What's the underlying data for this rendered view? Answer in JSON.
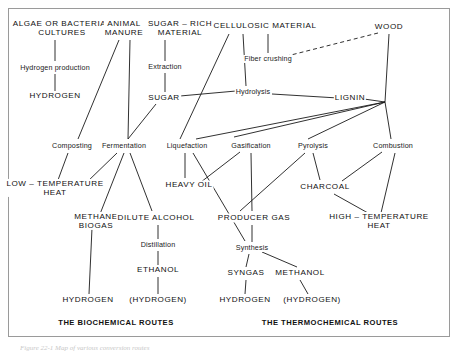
{
  "figure": {
    "caption": "Figure 22-1  Map of various conversion routes",
    "frame_color": "#9a9a9a"
  },
  "section_titles": {
    "biochemical": "THE BIOCHEMICAL ROUTES",
    "thermochemical": "THE THERMOCHEMICAL ROUTES"
  },
  "nodes": [
    {
      "id": "algae",
      "label": "ALGAE OR BACTERIAL\nCULTURES",
      "x": 62,
      "y": 28,
      "style": "cap"
    },
    {
      "id": "animal",
      "label": "ANIMAL\nMANURE",
      "x": 124,
      "y": 28,
      "style": "cap"
    },
    {
      "id": "sugarrich",
      "label": "SUGAR – RICH\nMATERIAL",
      "x": 180,
      "y": 28,
      "style": "cap"
    },
    {
      "id": "cellulosic",
      "label": "CELLULOSIC MATERIAL",
      "x": 265,
      "y": 26,
      "style": "cap"
    },
    {
      "id": "wood",
      "label": "WOOD",
      "x": 389,
      "y": 27,
      "style": "cap"
    },
    {
      "id": "hydprod",
      "label": "Hydrogen production",
      "x": 55,
      "y": 68,
      "style": "proc"
    },
    {
      "id": "extraction",
      "label": "Extraction",
      "x": 165,
      "y": 67,
      "style": "proc"
    },
    {
      "id": "fiber",
      "label": "Fiber crushing",
      "x": 268,
      "y": 59,
      "style": "proc"
    },
    {
      "id": "hydrogen_top",
      "label": "HYDROGEN",
      "x": 55,
      "y": 96,
      "style": "cap"
    },
    {
      "id": "sugar",
      "label": "SUGAR",
      "x": 164,
      "y": 98,
      "style": "cap"
    },
    {
      "id": "hydrolysis",
      "label": "Hydrolysis",
      "x": 253,
      "y": 92,
      "style": "proc"
    },
    {
      "id": "lignin",
      "label": "LIGNIN",
      "x": 350,
      "y": 98,
      "style": "cap"
    },
    {
      "id": "composting",
      "label": "Composting",
      "x": 72,
      "y": 146,
      "style": "proc"
    },
    {
      "id": "fermentation",
      "label": "Fermentation",
      "x": 124,
      "y": 146,
      "style": "proc"
    },
    {
      "id": "liquefaction",
      "label": "Liquefaction",
      "x": 187,
      "y": 146,
      "style": "proc"
    },
    {
      "id": "gasification",
      "label": "Gasification",
      "x": 251,
      "y": 146,
      "style": "proc"
    },
    {
      "id": "pyrolysis",
      "label": "Pyrolysis",
      "x": 313,
      "y": 146,
      "style": "proc"
    },
    {
      "id": "combustion",
      "label": "Combustion",
      "x": 393,
      "y": 146,
      "style": "proc"
    },
    {
      "id": "lowtemp",
      "label": "LOW – TEMPERATURE\nHEAT",
      "x": 55,
      "y": 188,
      "style": "cap"
    },
    {
      "id": "heavyoil",
      "label": "HEAVY OIL",
      "x": 189,
      "y": 185,
      "style": "cap"
    },
    {
      "id": "charcoal",
      "label": "CHARCOAL",
      "x": 325,
      "y": 187,
      "style": "cap"
    },
    {
      "id": "methane",
      "label": "METHANE\nBIOGAS",
      "x": 96,
      "y": 221,
      "style": "cap"
    },
    {
      "id": "dilute",
      "label": "DILUTE ALCOHOL",
      "x": 156,
      "y": 218,
      "style": "cap"
    },
    {
      "id": "producergas",
      "label": "PRODUCER GAS",
      "x": 254,
      "y": 218,
      "style": "cap"
    },
    {
      "id": "hightemp",
      "label": "HIGH – TEMPERATURE\nHEAT",
      "x": 379,
      "y": 221,
      "style": "cap"
    },
    {
      "id": "distillation",
      "label": "Distillation",
      "x": 158,
      "y": 245,
      "style": "proc"
    },
    {
      "id": "synthesis",
      "label": "Synthesis",
      "x": 252,
      "y": 248,
      "style": "proc"
    },
    {
      "id": "ethanol",
      "label": "ETHANOL",
      "x": 158,
      "y": 270,
      "style": "cap"
    },
    {
      "id": "syngas",
      "label": "SYNGAS",
      "x": 246,
      "y": 273,
      "style": "cap"
    },
    {
      "id": "methanol",
      "label": "METHANOL",
      "x": 300,
      "y": 273,
      "style": "cap"
    },
    {
      "id": "hydrogen_bl",
      "label": "HYDROGEN",
      "x": 88,
      "y": 300,
      "style": "cap"
    },
    {
      "id": "hydrogen_bl2",
      "label": "(HYDROGEN)",
      "x": 158,
      "y": 300,
      "style": "cap"
    },
    {
      "id": "hydrogen_br",
      "label": "HYDROGEN",
      "x": 245,
      "y": 300,
      "style": "cap"
    },
    {
      "id": "hydrogen_br2",
      "label": "(HYDROGEN)",
      "x": 312,
      "y": 300,
      "style": "cap"
    },
    {
      "id": "biochem_title",
      "label": "THE BIOCHEMICAL ROUTES",
      "x": 116,
      "y": 323,
      "style": "route-title"
    },
    {
      "id": "thermo_title",
      "label": "THE THERMOCHEMICAL ROUTES",
      "x": 330,
      "y": 323,
      "style": "route-title"
    }
  ],
  "edges": [
    {
      "from": "algae",
      "to": "hydprod",
      "x1": 55,
      "y1": 40,
      "x2": 55,
      "y2": 61,
      "dash": false
    },
    {
      "from": "hydprod",
      "to": "hydrogen_top",
      "x1": 55,
      "y1": 74,
      "x2": 55,
      "y2": 91,
      "dash": false
    },
    {
      "from": "animal",
      "to": "composting",
      "x1": 119,
      "y1": 40,
      "x2": 78,
      "y2": 139,
      "dash": false
    },
    {
      "from": "animal",
      "to": "fermentation",
      "x1": 130,
      "y1": 40,
      "x2": 128,
      "y2": 139,
      "dash": false
    },
    {
      "from": "sugarrich",
      "to": "extraction",
      "x1": 165,
      "y1": 40,
      "x2": 165,
      "y2": 61,
      "dash": false
    },
    {
      "from": "extraction",
      "to": "sugar",
      "x1": 165,
      "y1": 73,
      "x2": 165,
      "y2": 92,
      "dash": false
    },
    {
      "from": "sugar",
      "to": "fermentation",
      "x1": 156,
      "y1": 104,
      "x2": 128,
      "y2": 139,
      "dash": false
    },
    {
      "from": "sugar",
      "to": "hydrolysis",
      "x1": 180,
      "y1": 96,
      "x2": 236,
      "y2": 91,
      "dash": false
    },
    {
      "from": "cellulosic",
      "to": "hydrolysis",
      "x1": 243,
      "y1": 34,
      "x2": 246,
      "y2": 86,
      "dash": false
    },
    {
      "from": "cellulosic",
      "to": "fiber",
      "x1": 268,
      "y1": 34,
      "x2": 268,
      "y2": 53,
      "dash": false
    },
    {
      "from": "cellulosic",
      "to": "liquefaction",
      "x1": 229,
      "y1": 34,
      "x2": 180,
      "y2": 139,
      "dash": false
    },
    {
      "from": "wood",
      "to": "fiber",
      "x1": 378,
      "y1": 33,
      "x2": 287,
      "y2": 56,
      "dash": true
    },
    {
      "from": "wood",
      "to": "hub",
      "x1": 389,
      "y1": 34,
      "x2": 385,
      "y2": 102,
      "dash": false
    },
    {
      "from": "hydrolysis",
      "to": "lignin",
      "x1": 272,
      "y1": 94,
      "x2": 338,
      "y2": 98,
      "dash": false
    },
    {
      "from": "lignin",
      "to": "hub",
      "x1": 364,
      "y1": 99,
      "x2": 385,
      "y2": 102,
      "dash": false
    },
    {
      "from": "hub",
      "to": "liquefaction",
      "x1": 385,
      "y1": 102,
      "x2": 196,
      "y2": 139,
      "dash": false
    },
    {
      "from": "hub",
      "to": "gasification",
      "x1": 385,
      "y1": 102,
      "x2": 234,
      "y2": 137,
      "dash": false
    },
    {
      "from": "hub",
      "to": "pyrolysis",
      "x1": 385,
      "y1": 102,
      "x2": 308,
      "y2": 139,
      "dash": false
    },
    {
      "from": "hub",
      "to": "combustion",
      "x1": 385,
      "y1": 102,
      "x2": 391,
      "y2": 139,
      "dash": false
    },
    {
      "from": "composting",
      "to": "lowtemp",
      "x1": 68,
      "y1": 153,
      "x2": 58,
      "y2": 180,
      "dash": false
    },
    {
      "from": "fermentation",
      "to": "lowtemp",
      "x1": 117,
      "y1": 153,
      "x2": 86,
      "y2": 183,
      "dash": false
    },
    {
      "from": "fermentation",
      "to": "methane",
      "x1": 124,
      "y1": 153,
      "x2": 100,
      "y2": 214,
      "dash": false
    },
    {
      "from": "fermentation",
      "to": "dilute",
      "x1": 130,
      "y1": 153,
      "x2": 152,
      "y2": 211,
      "dash": false
    },
    {
      "from": "liquefaction",
      "to": "heavyoil",
      "x1": 185,
      "y1": 153,
      "x2": 185,
      "y2": 178,
      "dash": false
    },
    {
      "from": "liquefaction",
      "to": "synthesis",
      "x1": 193,
      "y1": 153,
      "x2": 245,
      "y2": 241,
      "dash": false
    },
    {
      "from": "gasification",
      "to": "producergas",
      "x1": 251,
      "y1": 153,
      "x2": 252,
      "y2": 211,
      "dash": false
    },
    {
      "from": "gasification",
      "to": "heavyoil",
      "x1": 240,
      "y1": 152,
      "x2": 201,
      "y2": 182,
      "dash": false
    },
    {
      "from": "pyrolysis",
      "to": "charcoal",
      "x1": 313,
      "y1": 153,
      "x2": 320,
      "y2": 180,
      "dash": false
    },
    {
      "from": "pyrolysis",
      "to": "producergas",
      "x1": 305,
      "y1": 153,
      "x2": 240,
      "y2": 211,
      "dash": false
    },
    {
      "from": "combustion",
      "to": "charcoal",
      "x1": 382,
      "y1": 152,
      "x2": 342,
      "y2": 181,
      "dash": false
    },
    {
      "from": "combustion",
      "to": "hightemp",
      "x1": 395,
      "y1": 153,
      "x2": 381,
      "y2": 213,
      "dash": false
    },
    {
      "from": "charcoal",
      "to": "hightemp",
      "x1": 334,
      "y1": 194,
      "x2": 368,
      "y2": 213,
      "dash": false
    },
    {
      "from": "producergas",
      "to": "synthesis",
      "x1": 252,
      "y1": 225,
      "x2": 252,
      "y2": 242,
      "dash": false
    },
    {
      "from": "dilute",
      "to": "distillation",
      "x1": 158,
      "y1": 225,
      "x2": 158,
      "y2": 239,
      "dash": false
    },
    {
      "from": "distillation",
      "to": "ethanol",
      "x1": 158,
      "y1": 251,
      "x2": 158,
      "y2": 265,
      "dash": false
    },
    {
      "from": "synthesis",
      "to": "syngas",
      "x1": 249,
      "y1": 254,
      "x2": 246,
      "y2": 267,
      "dash": false
    },
    {
      "from": "synthesis",
      "to": "methanol",
      "x1": 262,
      "y1": 252,
      "x2": 297,
      "y2": 267,
      "dash": false
    },
    {
      "from": "methane",
      "to": "hydrogen_bl",
      "x1": 92,
      "y1": 228,
      "x2": 89,
      "y2": 294,
      "dash": false
    },
    {
      "from": "ethanol",
      "to": "hydrogen_bl2",
      "x1": 158,
      "y1": 277,
      "x2": 158,
      "y2": 294,
      "dash": false
    },
    {
      "from": "syngas",
      "to": "hydrogen_br",
      "x1": 246,
      "y1": 280,
      "x2": 245,
      "y2": 294,
      "dash": false
    },
    {
      "from": "methanol",
      "to": "hydrogen_br2",
      "x1": 300,
      "y1": 280,
      "x2": 308,
      "y2": 294,
      "dash": false
    }
  ],
  "style": {
    "line_color": "#1a1a1a",
    "line_width": 0.9,
    "background": "#ffffff"
  }
}
